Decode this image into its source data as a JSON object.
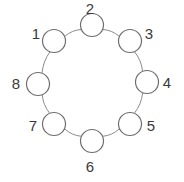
{
  "figure": {
    "type": "cycle-graph",
    "title": "",
    "background_color": "#ffffff",
    "node_stroke_color": "#6e6e6e",
    "node_fill_color": "#ffffff",
    "edge_stroke_color": "#8c8c8c",
    "label_color": "#3a3a3a",
    "node_count": 8,
    "node_radius": 11.5,
    "ring_center_x": 92,
    "ring_center_y": 83,
    "ring_radius": 58
  },
  "nodes": [
    {
      "label": "1",
      "cx": 54,
      "cy": 41,
      "label_x": 36,
      "label_y": 26
    },
    {
      "label": "2",
      "cx": 92,
      "cy": 25,
      "label_x": 90,
      "label_y": 1
    },
    {
      "label": "3",
      "cx": 130,
      "cy": 41,
      "label_x": 149,
      "label_y": 26
    },
    {
      "label": "4",
      "cx": 147,
      "cy": 82,
      "label_x": 167,
      "label_y": 75
    },
    {
      "label": "5",
      "cx": 130,
      "cy": 124,
      "label_x": 151,
      "label_y": 118
    },
    {
      "label": "6",
      "cx": 92,
      "cy": 141,
      "label_x": 90,
      "label_y": 159
    },
    {
      "label": "7",
      "cx": 54,
      "cy": 124,
      "label_x": 33,
      "label_y": 118
    },
    {
      "label": "8",
      "cx": 38,
      "cy": 84,
      "label_x": 16,
      "label_y": 76
    }
  ],
  "edges": [
    {
      "from": "1",
      "to": "2"
    },
    {
      "from": "2",
      "to": "3"
    },
    {
      "from": "3",
      "to": "4"
    },
    {
      "from": "4",
      "to": "5"
    },
    {
      "from": "5",
      "to": "6"
    },
    {
      "from": "6",
      "to": "7"
    },
    {
      "from": "7",
      "to": "8"
    },
    {
      "from": "8",
      "to": "1"
    }
  ],
  "chart_data": {
    "type": "diagram",
    "diagram_type": "cycle-graph",
    "title": "",
    "nodes": [
      "1",
      "2",
      "3",
      "4",
      "5",
      "6",
      "7",
      "8"
    ],
    "edges": [
      [
        "1",
        "2"
      ],
      [
        "2",
        "3"
      ],
      [
        "3",
        "4"
      ],
      [
        "4",
        "5"
      ],
      [
        "5",
        "6"
      ],
      [
        "6",
        "7"
      ],
      [
        "7",
        "8"
      ],
      [
        "8",
        "1"
      ]
    ],
    "layout": "circular",
    "node_order_clockwise_from_top": [
      "2",
      "3",
      "4",
      "5",
      "6",
      "7",
      "8",
      "1"
    ]
  }
}
